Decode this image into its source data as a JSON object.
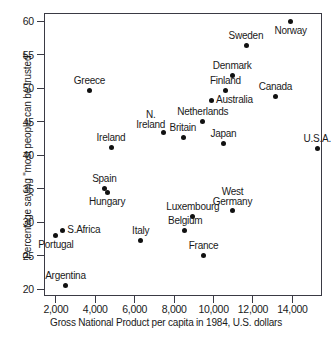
{
  "chart_data": {
    "type": "scatter",
    "title": "",
    "xlabel": "Gross National Product per capita in 1984, U.S. dollars",
    "ylabel": "Percentage saying \"most people can be trusted\"",
    "xlim": [
      1400,
      15500
    ],
    "ylim": [
      19.0,
      61.2
    ],
    "grid": false,
    "legend": "none",
    "xticks": [
      2000,
      4000,
      6000,
      8000,
      10000,
      12000,
      14000
    ],
    "xtick_labels": [
      "2,000",
      "4,000",
      "6,000",
      "8,000",
      "10,000",
      "12,000",
      "14,000"
    ],
    "yticks": [
      20,
      25,
      30,
      35,
      40,
      45,
      50,
      55,
      60
    ],
    "ytick_labels": [
      "20",
      "25",
      "30",
      "35",
      "40",
      "45",
      "50",
      "55",
      "60"
    ],
    "points": [
      {
        "label": "Norway",
        "x": 13900,
        "y": 59.9,
        "label_pos": "below"
      },
      {
        "label": "Sweden",
        "x": 11650,
        "y": 56.4,
        "label_pos": "above"
      },
      {
        "label": "Denmark",
        "x": 10950,
        "y": 51.9,
        "label_pos": "above"
      },
      {
        "label": "Finland",
        "x": 10600,
        "y": 49.6,
        "label_pos": "above"
      },
      {
        "label": "Canada",
        "x": 13150,
        "y": 48.7,
        "label_pos": "above"
      },
      {
        "label": "Australia",
        "x": 9900,
        "y": 48.2,
        "label_pos": "right"
      },
      {
        "label": "Greece",
        "x": 3700,
        "y": 49.7,
        "label_pos": "above"
      },
      {
        "label": "Netherlands",
        "x": 9450,
        "y": 45.0,
        "label_pos": "above"
      },
      {
        "label": "N. Ireland",
        "x": 7450,
        "y": 43.4,
        "label_pos": "above-left",
        "lines": [
          "N.",
          "Ireland"
        ]
      },
      {
        "label": "Britain",
        "x": 8450,
        "y": 42.7,
        "label_pos": "above"
      },
      {
        "label": "Japan",
        "x": 10500,
        "y": 41.8,
        "label_pos": "above"
      },
      {
        "label": "Ireland",
        "x": 4800,
        "y": 41.1,
        "label_pos": "above"
      },
      {
        "label": "U.S.A.",
        "x": 15250,
        "y": 41.0,
        "label_pos": "above"
      },
      {
        "label": "Spain",
        "x": 4450,
        "y": 35.0,
        "label_pos": "above"
      },
      {
        "label": "Hungary",
        "x": 4600,
        "y": 34.4,
        "label_pos": "below"
      },
      {
        "label": "West Germany",
        "x": 10950,
        "y": 31.7,
        "label_pos": "above",
        "lines": [
          "West",
          "Germany"
        ]
      },
      {
        "label": "Luxembourg",
        "x": 8950,
        "y": 30.8,
        "label_pos": "above"
      },
      {
        "label": "Belgium",
        "x": 8550,
        "y": 28.7,
        "label_pos": "above"
      },
      {
        "label": "S. Africa",
        "x": 2350,
        "y": 28.7,
        "label_pos": "right",
        "text": "S.Africa"
      },
      {
        "label": "Portugal",
        "x": 2000,
        "y": 28.0,
        "label_pos": "below"
      },
      {
        "label": "Italy",
        "x": 6300,
        "y": 27.3,
        "label_pos": "above"
      },
      {
        "label": "France",
        "x": 9500,
        "y": 25.0,
        "label_pos": "above"
      },
      {
        "label": "Argentina",
        "x": 2500,
        "y": 20.5,
        "label_pos": "above"
      }
    ]
  }
}
